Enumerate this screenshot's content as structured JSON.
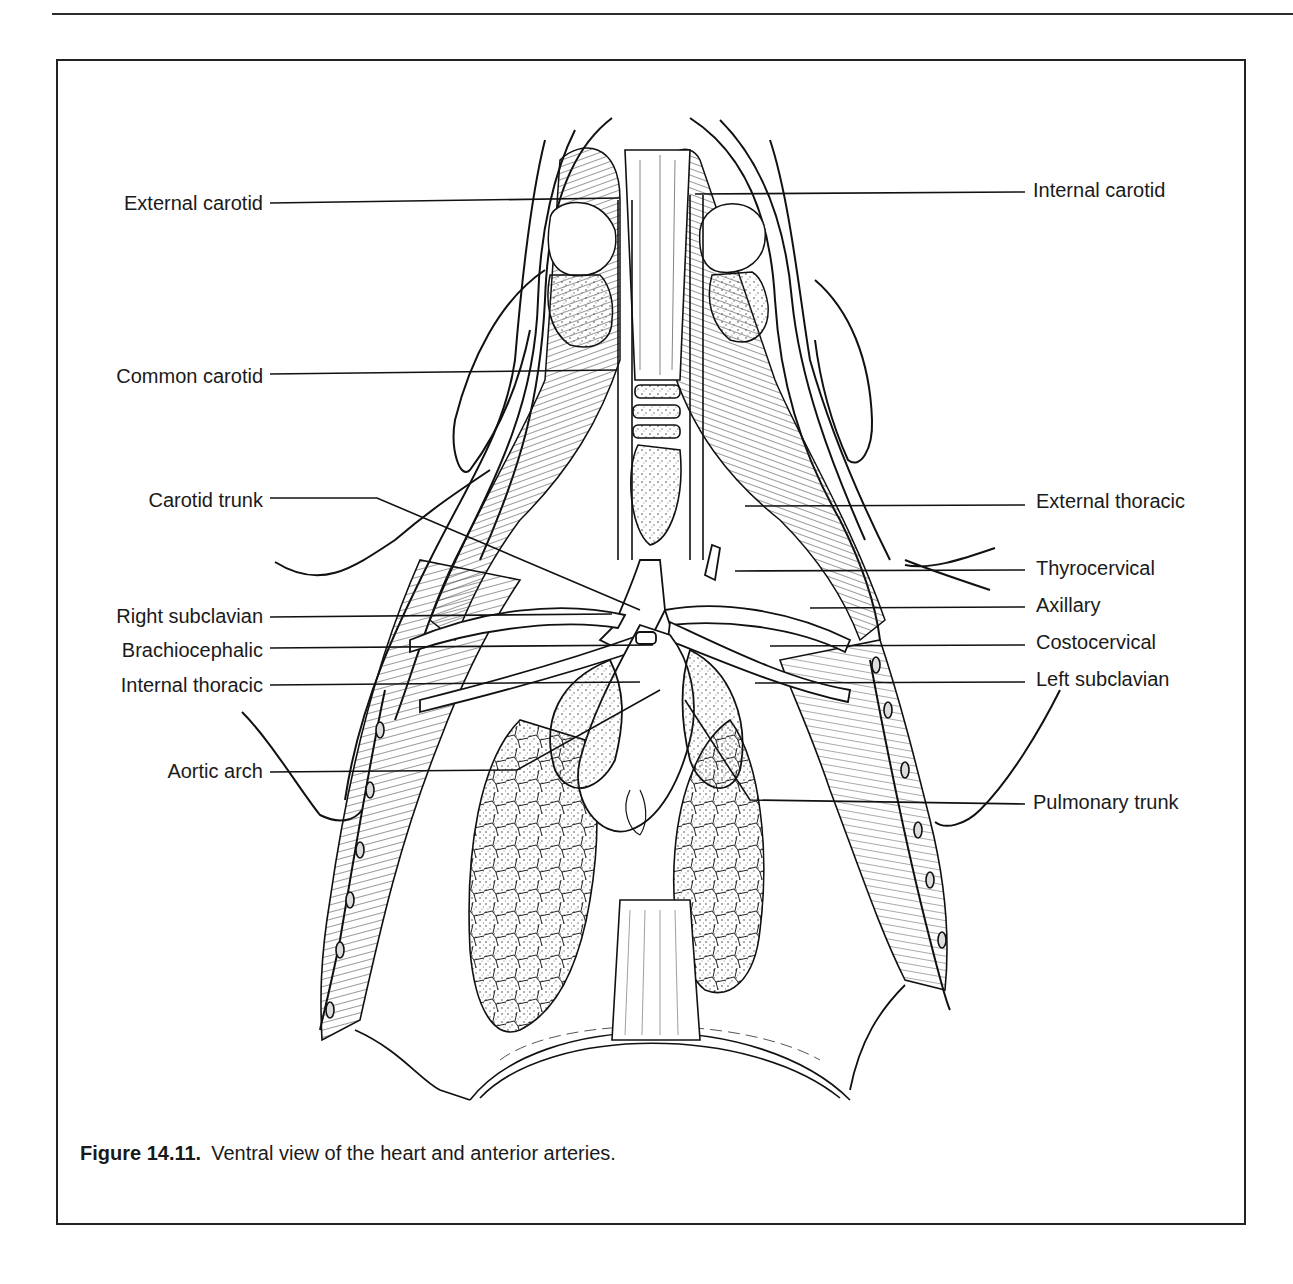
{
  "figure": {
    "number_label": "Figure 14.11.",
    "caption": "Ventral view of the heart and anterior arteries.",
    "labels_left": [
      {
        "id": "external-carotid",
        "text": "External carotid",
        "y": 203
      },
      {
        "id": "common-carotid",
        "text": "Common carotid",
        "y": 376
      },
      {
        "id": "carotid-trunk",
        "text": "Carotid trunk",
        "y": 500
      },
      {
        "id": "right-subclavian",
        "text": "Right subclavian",
        "y": 616
      },
      {
        "id": "brachiocephalic",
        "text": "Brachiocephalic",
        "y": 650
      },
      {
        "id": "internal-thoracic",
        "text": "Internal thoracic",
        "y": 685
      },
      {
        "id": "aortic-arch",
        "text": "Aortic arch",
        "y": 771
      }
    ],
    "labels_right": [
      {
        "id": "internal-carotid",
        "text": "Internal carotid",
        "y": 190
      },
      {
        "id": "external-thoracic",
        "text": "External thoracic",
        "y": 501
      },
      {
        "id": "thyrocervical",
        "text": "Thyrocervical",
        "y": 568
      },
      {
        "id": "axillary",
        "text": "Axillary",
        "y": 605
      },
      {
        "id": "costocervical",
        "text": "Costocervical",
        "y": 642
      },
      {
        "id": "left-subclavian",
        "text": "Left subclavian",
        "y": 679
      },
      {
        "id": "pulmonary-trunk",
        "text": "Pulmonary trunk",
        "y": 802
      }
    ]
  }
}
